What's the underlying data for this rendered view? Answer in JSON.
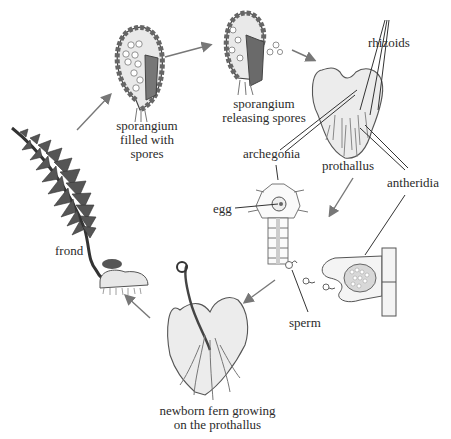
{
  "diagram": {
    "labels": {
      "sporangium_filled": [
        "sporangium",
        "filled with",
        "spores"
      ],
      "sporangium_releasing": [
        "sporangium",
        "releasing spores"
      ],
      "rhizoids": "rhizoids",
      "archegonia": "archegonia",
      "prothallus": "prothallus",
      "antheridia": "antheridia",
      "egg": "egg",
      "sperm": "sperm",
      "frond": "frond",
      "newborn_fern": [
        "newborn fern growing",
        "on the prothallus"
      ]
    },
    "colors": {
      "ink": "#2b2b2b",
      "dark_fill": "#555555",
      "mid_fill": "#8a8a8a",
      "light_fill": "#e4e4e4",
      "arrow": "#777777"
    }
  }
}
